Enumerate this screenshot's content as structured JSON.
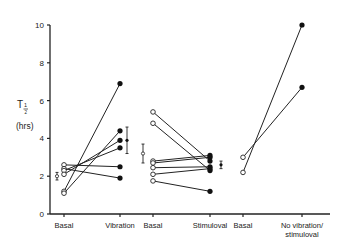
{
  "chart_data": {
    "type": "line",
    "title": "",
    "xlabel": "",
    "ylabel": "T½ (hrs)",
    "ylabel_main": "T",
    "ylabel_sub": "1/2",
    "ylabel_unit": "(hrs)",
    "ylim": [
      0,
      10
    ],
    "yticks": [
      0,
      2,
      4,
      6,
      8,
      10
    ],
    "grid": false,
    "legend": null,
    "categories": [
      "Basal",
      "Vibration",
      "Basal",
      "Stimuloval",
      "Basal",
      "No vibration/ stimuloval"
    ],
    "category_lines": [
      [
        "Basal"
      ],
      [
        "Vibration"
      ],
      [
        "Basal"
      ],
      [
        "Stimuloval"
      ],
      [
        "Basal"
      ],
      [
        "No vibration/",
        "stimuloval"
      ]
    ],
    "groups": [
      {
        "name": "Vibration",
        "from": "Basal",
        "to": "Vibration",
        "pairs": [
          [
            2.6,
            2.5
          ],
          [
            2.4,
            1.9
          ],
          [
            2.3,
            3.5
          ],
          [
            2.1,
            3.9
          ],
          [
            1.2,
            6.9
          ],
          [
            1.1,
            4.4
          ]
        ],
        "basal_mean": 2.0,
        "basal_err": 0.2,
        "treat_mean": 3.9,
        "treat_err": 0.7
      },
      {
        "name": "Stimuloval",
        "from": "Basal",
        "to": "Stimuloval",
        "pairs": [
          [
            5.4,
            2.8
          ],
          [
            4.8,
            2.3
          ],
          [
            2.8,
            3.1
          ],
          [
            2.7,
            3.0
          ],
          [
            2.45,
            2.5
          ],
          [
            2.1,
            2.4
          ],
          [
            1.75,
            1.2
          ]
        ],
        "basal_mean": 3.2,
        "basal_err": 0.5,
        "treat_mean": 2.6,
        "treat_err": 0.2
      },
      {
        "name": "No vibration/stimuloval",
        "from": "Basal",
        "to": "No vibration/stimuloval",
        "pairs": [
          [
            3.0,
            6.7
          ],
          [
            2.2,
            10.0
          ]
        ]
      }
    ]
  }
}
